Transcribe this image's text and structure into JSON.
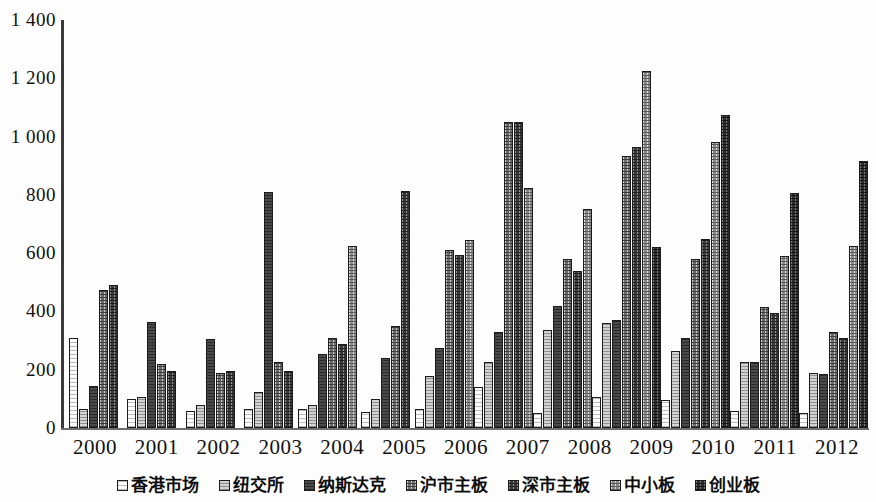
{
  "chart_data": {
    "type": "bar",
    "title": "",
    "subtitle": "",
    "xlabel": "",
    "ylabel": "",
    "ylim": [
      0,
      1400
    ],
    "yticks": [
      0,
      200,
      400,
      600,
      800,
      1000,
      1200,
      1400
    ],
    "ytick_labels": [
      "0",
      "200",
      "400",
      "600",
      "800",
      "1 000",
      "1 200",
      "1 400"
    ],
    "grid": false,
    "legend_position": "bottom",
    "categories": [
      "2000",
      "2001",
      "2002",
      "2003",
      "2004",
      "2005",
      "2006",
      "2007",
      "2008",
      "2009",
      "2010",
      "2011",
      "2012"
    ],
    "series": [
      {
        "name": "香港市场",
        "color": "#fafafa",
        "values": [
          310,
          100,
          60,
          65,
          65,
          55,
          65,
          140,
          50,
          105,
          95,
          60,
          50
        ]
      },
      {
        "name": "纽交所",
        "color": "#d2d2d2",
        "values": [
          65,
          105,
          80,
          125,
          80,
          100,
          180,
          225,
          335,
          360,
          265,
          225,
          190
        ]
      },
      {
        "name": "纳斯达克",
        "color": "#4a4a4a",
        "values": [
          145,
          365,
          305,
          810,
          255,
          240,
          275,
          330,
          420,
          370,
          310,
          225,
          185
        ]
      },
      {
        "name": "沪市主板",
        "color": "#6d6d6d",
        "values": [
          475,
          220,
          190,
          225,
          310,
          350,
          610,
          1050,
          580,
          935,
          580,
          415,
          330
        ]
      },
      {
        "name": "深市主板",
        "color": "#3b3b3b",
        "values": [
          490,
          195,
          195,
          195,
          290,
          815,
          595,
          1050,
          540,
          965,
          650,
          395,
          310
        ]
      },
      {
        "name": "中小板",
        "color": "#8a8a8a",
        "values": [
          null,
          null,
          null,
          null,
          625,
          null,
          645,
          825,
          750,
          1225,
          980,
          590,
          625
        ]
      },
      {
        "name": "创业板",
        "color": "#2e2e2e",
        "values": [
          null,
          null,
          null,
          null,
          null,
          null,
          null,
          null,
          null,
          620,
          1075,
          805,
          915
        ]
      }
    ]
  },
  "legend": {
    "items": [
      {
        "label": "香港市场"
      },
      {
        "label": "纽交所"
      },
      {
        "label": "纳斯达克"
      },
      {
        "label": "沪市主板"
      },
      {
        "label": "深市主板"
      },
      {
        "label": "中小板"
      },
      {
        "label": "创业板"
      }
    ]
  }
}
